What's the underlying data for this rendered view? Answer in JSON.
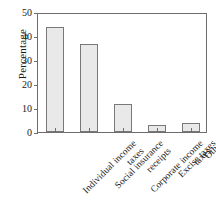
{
  "chart_data": {
    "type": "bar",
    "title": "",
    "xlabel": "",
    "ylabel": "Percentage",
    "ylim": [
      0,
      50
    ],
    "yticks": [
      0,
      10,
      20,
      30,
      40,
      50
    ],
    "grid": false,
    "legend": null,
    "categories": [
      "Individual income taxes",
      "Social insurance receipts",
      "Corporate income taxes",
      "Excise taxes",
      "Other"
    ],
    "category_lines": [
      [
        "Individual income",
        "taxes"
      ],
      [
        "Social insurance",
        "receipts"
      ],
      [
        "Corporate income",
        "taxes"
      ],
      [
        "Excise taxes",
        ""
      ],
      [
        "Other",
        ""
      ]
    ],
    "values": [
      43.8,
      36.7,
      11.7,
      2.9,
      3.7
    ],
    "bar_fill": "#e9e9e9",
    "bar_edge": "#787878",
    "axis_color": "#6e6e6e"
  }
}
